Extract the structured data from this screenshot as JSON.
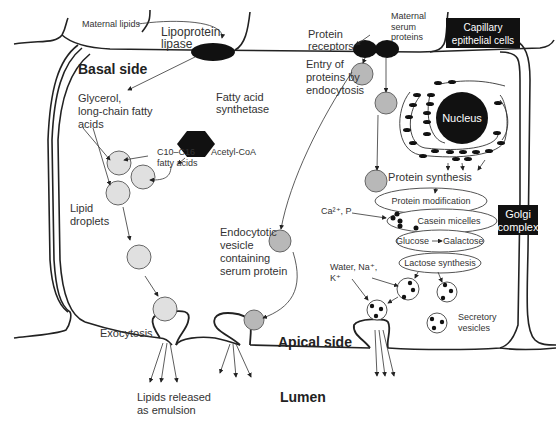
{
  "diagram": {
    "colors": {
      "membrane": "#222222",
      "lipid_droplet": "#e0e0e0",
      "protein_vesicle": "#b8b8b8",
      "black_box": "#111111",
      "text": "#333333"
    },
    "labels": {
      "maternal_lipids": "Maternal lipids",
      "lipoprotein_lipase_1": "Lipoprotein",
      "lipoprotein_lipase_2": "lipase",
      "basal_side": "Basal side",
      "glycerol_1": "Glycerol,",
      "glycerol_2": "long-chain fatty",
      "glycerol_3": "acids",
      "fatty_acid_synthetase_1": "Fatty acid",
      "fatty_acid_synthetase_2": "synthetase",
      "acetyl_coa": "Acetyl-CoA",
      "c10_c16_1": "C10–C16",
      "c10_c16_2": "fatty acids",
      "lipid_droplets_1": "Lipid",
      "lipid_droplets_2": "droplets",
      "exocytosis": "Exocytosis",
      "lipids_released_1": "Lipids released",
      "lipids_released_2": "as emulsion",
      "protein_receptors_1": "Protein",
      "protein_receptors_2": "receptors",
      "maternal_serum_1": "Maternal",
      "maternal_serum_2": "serum",
      "maternal_serum_3": "proteins",
      "capillary_1": "Capillary",
      "capillary_2": "epithelial cells",
      "entry_1": "Entry of",
      "entry_2": "proteins by",
      "entry_3": "endocytosis",
      "nucleus": "Nucleus",
      "protein_synthesis": "Protein synthesis",
      "protein_modification": "Protein modification",
      "ca_p": "Ca²⁺, P",
      "casein_micelles": "Casein micelles",
      "golgi_1": "Golgi",
      "golgi_2": "complex",
      "glucose": "Glucose",
      "galactose": "Galactose",
      "lactose_synthesis": "Lactose synthesis",
      "endocytotic_1": "Endocytotic",
      "endocytotic_2": "vesicle",
      "endocytotic_3": "containing",
      "endocytotic_4": "serum protein",
      "water_1": "Water, Na⁺,",
      "water_2": "K⁺",
      "secretory_1": "Secretory",
      "secretory_2": "vesicles",
      "apical_side": "Apical side",
      "lumen": "Lumen"
    }
  }
}
